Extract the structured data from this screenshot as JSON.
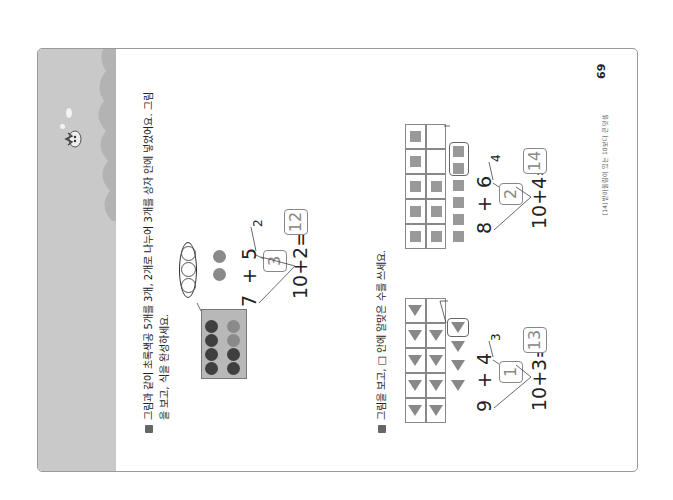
{
  "page": {
    "orientation": "rotated-90-ccw",
    "page_number": "69",
    "footer_text": "[14] 받아올림이 있는 10보다 큰 덧셈"
  },
  "problem1": {
    "instruction_line1": "그림과 같이 초록색공 5개를 3개, 2개로 나누어 3개를 상자 안에 넣었어요. 그림",
    "instruction_line2": "을 보고, 식을 완성하세요.",
    "ten_frame": {
      "rows": 2,
      "cols": 5,
      "top_row": [
        "dark",
        "dark",
        "dark",
        "dark",
        "dark"
      ],
      "bottom_row": [
        "mid",
        "mid",
        "mid",
        "dark",
        "dark"
      ]
    },
    "grouped_circles": 3,
    "leftover_balls": 2,
    "equation": {
      "a": "7",
      "plus": "+",
      "b": "5",
      "split_box": "3",
      "split_rest": "2",
      "sum_left": "10+2=",
      "answer": "12"
    }
  },
  "problem2": {
    "instruction": "그림을 보고, □ 안에 알맞은 수를 쓰세요.",
    "items": [
      {
        "shape": "triangle",
        "frame_filled": 9,
        "extra_shapes": 4,
        "moved": 1,
        "equation": {
          "a": "9",
          "plus": "+",
          "b": "4",
          "split_box": "1",
          "split_rest": "3",
          "sum_left": "10+3=",
          "answer": "13"
        }
      },
      {
        "shape": "square",
        "frame_filled": 8,
        "extra_shapes": 6,
        "moved": 2,
        "equation": {
          "a": "8",
          "plus": "+",
          "b": "6",
          "split_box": "2",
          "split_rest": "4",
          "sum_left": "10+4=",
          "answer": "14"
        }
      }
    ]
  },
  "colors": {
    "banner": "#c9c9c9",
    "frame_border": "#9a9a9a",
    "answer_text": "#888888"
  }
}
